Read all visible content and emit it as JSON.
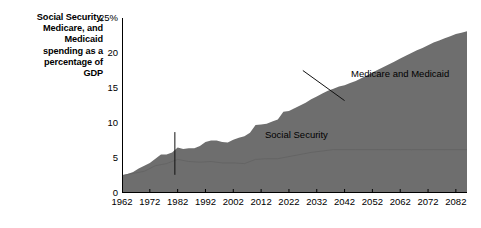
{
  "title": "Social Security, Medicare, and Medicaid spending as a percentage of GDP",
  "title_lines": [
    "Social Security,",
    "Medicare, and",
    "Medicaid",
    "spending as a",
    "percentage of",
    "GDP"
  ],
  "colors": {
    "area_fill": "#6e6e6e",
    "axis": "#000000",
    "text": "#000000",
    "background": "#ffffff",
    "inner_line": "#626262"
  },
  "annotations": [
    {
      "id": "social-security",
      "label": "Social Security"
    },
    {
      "id": "medicare-medicaid",
      "label": "Medicare and Medicaid"
    }
  ],
  "chart_data": {
    "type": "area",
    "title": "Social Security, Medicare, and Medicaid spending as a percentage of GDP",
    "xlabel": "",
    "ylabel": "",
    "xlim": [
      1962,
      2086
    ],
    "ylim": [
      0,
      25
    ],
    "grid": false,
    "legend": "none",
    "yticks": [
      0,
      5,
      10,
      15,
      20,
      25
    ],
    "ytick_labels": [
      "0",
      "5",
      "10",
      "15",
      "20",
      "25%"
    ],
    "xticks": [
      1962,
      1972,
      1982,
      1992,
      2002,
      2012,
      2022,
      2032,
      2042,
      2052,
      2062,
      2072,
      2082
    ],
    "xtick_labels": [
      "1962",
      "1972",
      "1982",
      "1992",
      "2002",
      "2012",
      "2022",
      "2032",
      "2042",
      "2052",
      "2062",
      "2072",
      "2082"
    ],
    "annotations": [
      {
        "text": "Social Security",
        "text_x": 1969,
        "text_y": 9.6,
        "leader": {
          "x1": 1981,
          "y1": 8.7,
          "x2": 1981,
          "y2": 2.6
        }
      },
      {
        "text": "Medicare and Medicaid",
        "text_x": 2000,
        "text_y": 18.8,
        "leader": {
          "x1": 2027,
          "y1": 17.5,
          "x2": 2042,
          "y2": 13.2
        }
      }
    ],
    "series": [
      {
        "name": "Total (Social Security + Medicare + Medicaid)",
        "x": [
          1962,
          1964,
          1966,
          1968,
          1970,
          1972,
          1974,
          1976,
          1978,
          1980,
          1982,
          1984,
          1986,
          1988,
          1990,
          1992,
          1994,
          1996,
          1998,
          2000,
          2002,
          2004,
          2006,
          2008,
          2010,
          2012,
          2014,
          2016,
          2018,
          2020,
          2022,
          2024,
          2026,
          2028,
          2030,
          2032,
          2034,
          2036,
          2038,
          2040,
          2042,
          2044,
          2046,
          2048,
          2050,
          2052,
          2054,
          2056,
          2058,
          2060,
          2062,
          2064,
          2066,
          2068,
          2070,
          2072,
          2074,
          2076,
          2078,
          2080,
          2082,
          2084,
          2086
        ],
        "values": [
          2.5,
          2.7,
          3.0,
          3.5,
          3.9,
          4.3,
          4.9,
          5.5,
          5.5,
          5.8,
          6.5,
          6.3,
          6.4,
          6.4,
          6.7,
          7.3,
          7.5,
          7.5,
          7.3,
          7.2,
          7.6,
          7.9,
          8.1,
          8.6,
          9.7,
          9.8,
          9.9,
          10.2,
          10.5,
          11.6,
          11.7,
          12.1,
          12.5,
          12.9,
          13.4,
          13.8,
          14.2,
          14.6,
          14.9,
          15.2,
          15.4,
          15.7,
          16.0,
          16.4,
          16.8,
          17.2,
          17.6,
          18.0,
          18.4,
          18.8,
          19.2,
          19.6,
          20.0,
          20.4,
          20.7,
          21.1,
          21.5,
          21.8,
          22.1,
          22.4,
          22.7,
          22.9,
          23.1
        ]
      },
      {
        "name": "Social Security",
        "x": [
          1962,
          1966,
          1970,
          1974,
          1978,
          1982,
          1986,
          1990,
          1994,
          1998,
          2002,
          2006,
          2010,
          2014,
          2018,
          2022,
          2026,
          2030,
          2034,
          2038,
          2042,
          2046,
          2050,
          2054,
          2058,
          2062,
          2066,
          2070,
          2074,
          2078,
          2082,
          2086
        ],
        "values": [
          2.5,
          2.8,
          3.1,
          3.9,
          4.2,
          4.8,
          4.5,
          4.4,
          4.5,
          4.3,
          4.3,
          4.2,
          4.8,
          4.9,
          4.9,
          5.2,
          5.5,
          5.8,
          6.0,
          6.2,
          6.2,
          6.2,
          6.2,
          6.2,
          6.2,
          6.2,
          6.2,
          6.2,
          6.2,
          6.2,
          6.2,
          6.2
        ]
      }
    ]
  }
}
